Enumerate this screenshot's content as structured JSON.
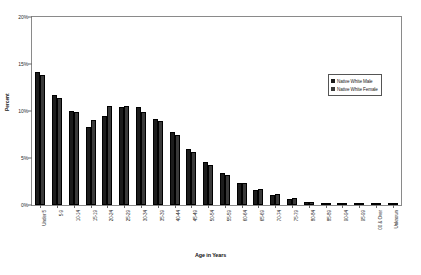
{
  "chart_data": {
    "type": "bar",
    "title": "",
    "xlabel": "Age in Years",
    "ylabel": "Percent",
    "ylim": [
      0,
      20
    ],
    "yticks": [
      0,
      5,
      10,
      15,
      20
    ],
    "ytick_labels": [
      "0%",
      "5%",
      "10%",
      "15%",
      "20%"
    ],
    "grid": false,
    "legend_position": "upper right",
    "categories": [
      "Under 5",
      "5-9",
      "10-14",
      "15-19",
      "20-24",
      "25-29",
      "30-34",
      "35-39",
      "40-44",
      "45-49",
      "50-54",
      "55-59",
      "60-64",
      "65-69",
      "70-74",
      "75-79",
      "80-84",
      "85-89",
      "90-94",
      "95-99",
      "00 & Over",
      "Unknown"
    ],
    "series": [
      {
        "name": "Native White Male",
        "color": "#1c1c1c",
        "values": [
          14.2,
          11.7,
          10.0,
          8.3,
          9.5,
          10.4,
          10.4,
          9.2,
          7.8,
          6.0,
          4.6,
          3.4,
          2.3,
          1.6,
          1.1,
          0.6,
          0.3,
          0.15,
          0.06,
          0.03,
          0.02,
          0.15
        ]
      },
      {
        "name": "Native White Female",
        "color": "#3a3a3a",
        "values": [
          13.8,
          11.4,
          9.9,
          9.0,
          10.5,
          10.5,
          9.9,
          8.9,
          7.4,
          5.6,
          4.3,
          3.2,
          2.3,
          1.7,
          1.2,
          0.7,
          0.35,
          0.18,
          0.07,
          0.03,
          0.02,
          0.15
        ]
      }
    ]
  },
  "legend": {
    "items": [
      {
        "label": "Native White Male"
      },
      {
        "label": "Native White Female"
      }
    ]
  },
  "axes": {
    "x_title": "Age in Years",
    "y_title": "Percent"
  }
}
